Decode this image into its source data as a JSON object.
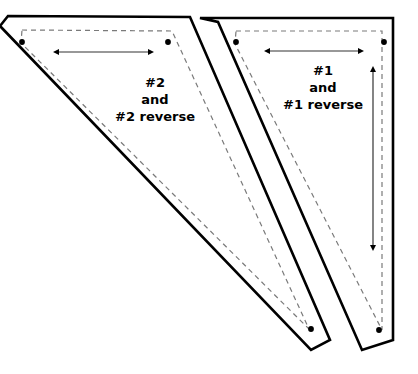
{
  "document": {
    "title": "Quilting Template Pattern Pieces",
    "background_color": "#ffffff",
    "ink_color": "#000000",
    "seamline_color": "#7a7a7a",
    "width": 418,
    "height": 374
  },
  "pieces": [
    {
      "id": "piece-2",
      "label_lines": [
        "#2",
        "and",
        "#2 reverse"
      ],
      "cut_outline_points": "8,16 190,17 330,340 311,350 0,26",
      "seam_line_points": "22,30 172,31 309,329 21,43",
      "dots": [
        {
          "name": "dot-top-left",
          "x": 22,
          "y": 42
        },
        {
          "name": "dot-top-right",
          "x": 168,
          "y": 42
        },
        {
          "name": "dot-bottom",
          "x": 311,
          "y": 329
        }
      ],
      "arrows": [
        {
          "name": "width-arrow",
          "orientation": "horizontal",
          "x1": 59,
          "y1": 52,
          "x2": 148,
          "y2": 52
        }
      ]
    },
    {
      "id": "piece-1",
      "label_lines": [
        "#1",
        "and",
        "#1 reverse"
      ],
      "cut_outline_points": "200,18 393,18 393,340 362,350 218,22",
      "seam_line_points": "236,31 382,31 382,330 235,44",
      "dots": [
        {
          "name": "dot-top-left",
          "x": 236,
          "y": 42
        },
        {
          "name": "dot-top-right",
          "x": 384,
          "y": 42
        },
        {
          "name": "dot-bottom",
          "x": 379,
          "y": 330
        }
      ],
      "arrows": [
        {
          "name": "width-arrow",
          "orientation": "horizontal",
          "x1": 270,
          "y1": 51,
          "x2": 358,
          "y2": 51
        },
        {
          "name": "height-arrow",
          "orientation": "vertical",
          "x1": 373,
          "y1": 72,
          "x2": 373,
          "y2": 245
        }
      ]
    }
  ]
}
